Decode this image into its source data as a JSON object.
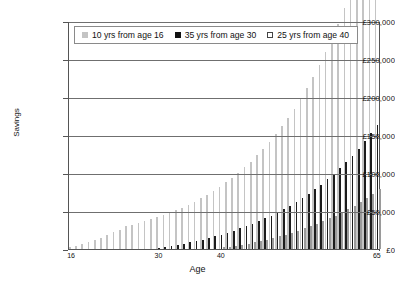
{
  "chart_data": {
    "type": "bar",
    "title": "",
    "xlabel": "Age",
    "ylabel": "Savings",
    "ylim": [
      0,
      300000
    ],
    "ytick_labels": [
      "£0",
      "£50,000",
      "£100,000",
      "£150,000",
      "£200,000",
      "£250,000",
      "£300,000"
    ],
    "ytick_values": [
      0,
      50000,
      100000,
      150000,
      200000,
      250000,
      300000
    ],
    "xtick_labels": [
      "16",
      "30",
      "40",
      "65"
    ],
    "xtick_values": [
      16,
      30,
      40,
      65
    ],
    "grid": true,
    "legend_position": "top-center",
    "categories": [
      16,
      17,
      18,
      19,
      20,
      21,
      22,
      23,
      24,
      25,
      26,
      27,
      28,
      29,
      30,
      31,
      32,
      33,
      34,
      35,
      36,
      37,
      38,
      39,
      40,
      41,
      42,
      43,
      44,
      45,
      46,
      47,
      48,
      49,
      50,
      51,
      52,
      53,
      54,
      55,
      56,
      57,
      58,
      59,
      60,
      61,
      62,
      63,
      64,
      65
    ],
    "series": [
      {
        "name": "10 yrs from age 16",
        "color": "#c4c4c4",
        "values": [
          2000,
          4200,
          6600,
          9200,
          12000,
          15000,
          18300,
          21800,
          25600,
          29700,
          31800,
          34000,
          36400,
          38900,
          41700,
          44600,
          47700,
          51000,
          54600,
          58400,
          62500,
          66900,
          71600,
          76600,
          82000,
          87700,
          93900,
          100400,
          107500,
          115000,
          123100,
          131700,
          140900,
          150800,
          161300,
          172600,
          184700,
          197600,
          211400,
          226200,
          242000,
          258900,
          277000,
          296400,
          317100,
          339300,
          363000,
          388400,
          415600,
          444700
        ]
      },
      {
        "name": "35 yrs from age 30",
        "color": "#1c1c1c",
        "values": [
          0,
          0,
          0,
          0,
          0,
          0,
          0,
          0,
          0,
          0,
          0,
          0,
          0,
          0,
          1200,
          2500,
          3900,
          5400,
          7000,
          8700,
          10500,
          12400,
          14500,
          16700,
          19000,
          21500,
          24200,
          27000,
          30000,
          33200,
          36600,
          40200,
          44000,
          48100,
          52400,
          57000,
          61900,
          67100,
          72600,
          78500,
          84800,
          91500,
          98600,
          106200,
          114300,
          122900,
          132100,
          141900,
          152400,
          163600
        ]
      },
      {
        "name": "25 yrs from age 40",
        "color": "#ffffff",
        "values": [
          0,
          0,
          0,
          0,
          0,
          0,
          0,
          0,
          0,
          0,
          0,
          0,
          0,
          0,
          0,
          0,
          0,
          0,
          0,
          0,
          0,
          0,
          0,
          0,
          1200,
          2500,
          3900,
          5400,
          7000,
          8700,
          10500,
          12400,
          14500,
          16700,
          19000,
          21500,
          24200,
          27000,
          30000,
          33200,
          36600,
          40200,
          44000,
          48100,
          52400,
          57000,
          61900,
          67100,
          72600,
          78500
        ]
      }
    ]
  }
}
